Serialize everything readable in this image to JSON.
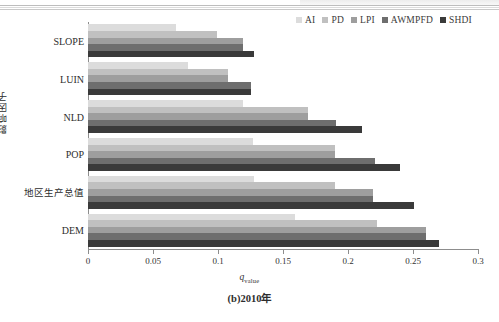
{
  "chart_data": {
    "type": "bar",
    "orientation": "horizontal",
    "title": "",
    "caption": "(b)2010年",
    "xlabel": "q_value",
    "xlabel_parts": {
      "italic": "q",
      "subscript": "value"
    },
    "ylabel": "影响因子",
    "xlim": [
      0,
      0.3
    ],
    "xticks": [
      0,
      0.05,
      0.1,
      0.15,
      0.2,
      0.25,
      0.3
    ],
    "xtick_labels": [
      "0",
      "0.05",
      "0.1",
      "0.15",
      "0.2",
      "0.25",
      "0.3"
    ],
    "grid": false,
    "legend_position": "top-right",
    "categories": [
      "SLOPE",
      "LUIN",
      "NLD",
      "POP",
      "地区生产总值",
      "DEM"
    ],
    "series": [
      {
        "name": "AI",
        "color": "#dcdcdc",
        "values": [
          0.068,
          0.077,
          0.119,
          0.127,
          0.128,
          0.159
        ]
      },
      {
        "name": "PD",
        "color": "#c0c0c0",
        "values": [
          0.099,
          0.108,
          0.169,
          0.19,
          0.19,
          0.222
        ]
      },
      {
        "name": "LPI",
        "color": "#9e9e9e",
        "values": [
          0.119,
          0.108,
          0.169,
          0.19,
          0.219,
          0.26
        ]
      },
      {
        "name": "AWMPFD",
        "color": "#6e6e6e",
        "values": [
          0.119,
          0.125,
          0.191,
          0.221,
          0.219,
          0.26
        ]
      },
      {
        "name": "SHDI",
        "color": "#3a3a3a",
        "values": [
          0.128,
          0.125,
          0.211,
          0.24,
          0.251,
          0.27
        ]
      }
    ]
  },
  "legend": {
    "items": [
      {
        "label": "AI"
      },
      {
        "label": "PD"
      },
      {
        "label": "LPI"
      },
      {
        "label": "AWMPFD"
      },
      {
        "label": "SHDI"
      }
    ]
  },
  "axes": {
    "x_title_html": "q_value",
    "y_title": "影响因子"
  },
  "caption": "(b)2010年"
}
